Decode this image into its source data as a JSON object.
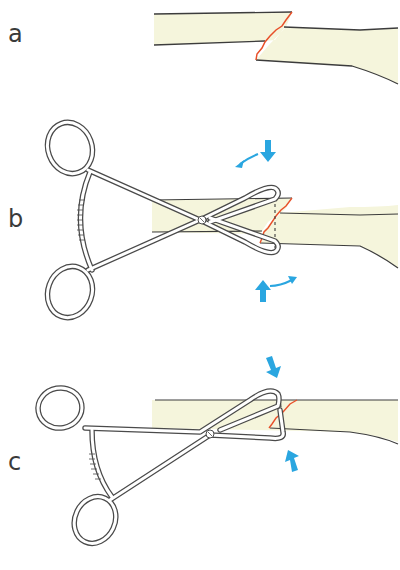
{
  "figure": {
    "panels": [
      {
        "id": "a",
        "label": "a",
        "description": "Displaced fracture of long bone"
      },
      {
        "id": "b",
        "label": "b",
        "description": "Pointed reduction forceps applied with rotation to reduce fracture"
      },
      {
        "id": "c",
        "label": "c",
        "description": "Forceps clamped compressing reduced fracture"
      }
    ],
    "colors": {
      "bone_fill": "#f5f5dc",
      "bone_outline": "#3c3c3c",
      "fracture_line": "#e8502a",
      "arrow": "#2aa6e0",
      "instrument_outline": "#4a4a4a",
      "instrument_fill": "#ffffff"
    }
  }
}
